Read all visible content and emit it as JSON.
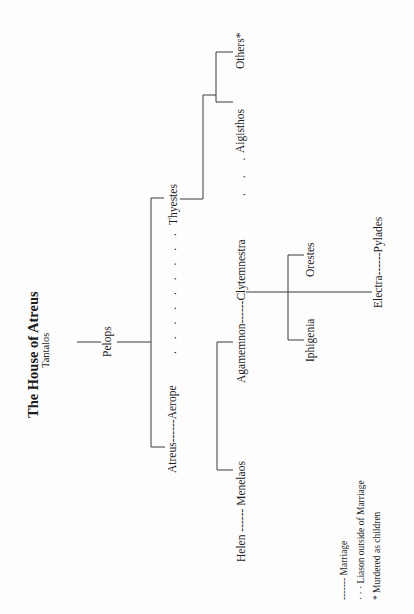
{
  "title": "The House of Atreus",
  "subtitle": "Tantalos",
  "people": {
    "pelops": "Pelops",
    "atreus_aerope": "Atreus------Aerope",
    "aerope_thyestes_dots": ". . . . . . . . .",
    "thyestes": "Thyestes",
    "aigisthos": "Aigisthos",
    "others": "Others*",
    "clytemnestra_aigisthos_dots": ". . .",
    "helen_menelaos": "Helen ------ Menelaos",
    "agamemnon_clytemnestra": "Agamemnon------Clytemnestra",
    "iphigenia": "Iphigenia",
    "orestes": "Orestes",
    "electra_pylades": "Electra------Pylades"
  },
  "legend": {
    "marriage": "------- Marriage",
    "liason": "·  ·  ·  Liason outside of Marriage",
    "murdered": "* Murdered as children"
  },
  "colors": {
    "line": "#3a3a3a",
    "text": "#1c1c1c",
    "background": "#fdfdfd"
  }
}
